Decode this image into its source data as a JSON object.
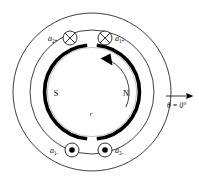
{
  "diagram": {
    "colors": {
      "line": "#1a1a1a",
      "rotor": "#000000",
      "background": "#ffffff"
    },
    "geometry": {
      "center_x": 92,
      "center_y": 92,
      "outer_stator_radius": 79,
      "stator_bore_radius": 62,
      "rotor_radius": 47,
      "rotor_stroke_width": 3.4
    },
    "poles": {
      "south_label": "S",
      "north_label": "N"
    },
    "radius_label": "r",
    "reference_axis": {
      "label_theta": "θ",
      "label_equals": " = ",
      "label_value": "0°",
      "full_label": "θ = 0°",
      "direction": "right"
    },
    "rotation": {
      "direction": "counterclockwise",
      "arrow_name": "rotation-arrow"
    },
    "conductors": [
      {
        "id": "a2-plus",
        "label_base": "a",
        "label_sub": "2+",
        "symbol": "cross",
        "symbol_meaning": "current-into-page",
        "position": "top-left",
        "cx": 70,
        "cy": 38,
        "label_x": 52,
        "label_y": 40
      },
      {
        "id": "a1-plus",
        "label_base": "a",
        "label_sub": "1+",
        "symbol": "cross",
        "symbol_meaning": "current-into-page",
        "position": "top-right",
        "cx": 105,
        "cy": 38,
        "label_x": 116,
        "label_y": 40
      },
      {
        "id": "a1-minus",
        "label_base": "a",
        "label_sub": "1-",
        "symbol": "dot",
        "symbol_meaning": "current-out-of-page",
        "position": "bottom-left",
        "cx": 72,
        "cy": 150,
        "label_x": 54,
        "label_y": 152
      },
      {
        "id": "a2-minus",
        "label_base": "a",
        "label_sub": "2-",
        "symbol": "dot",
        "symbol_meaning": "current-out-of-page",
        "position": "bottom-right",
        "cx": 105,
        "cy": 150,
        "label_x": 116,
        "label_y": 152
      }
    ]
  }
}
